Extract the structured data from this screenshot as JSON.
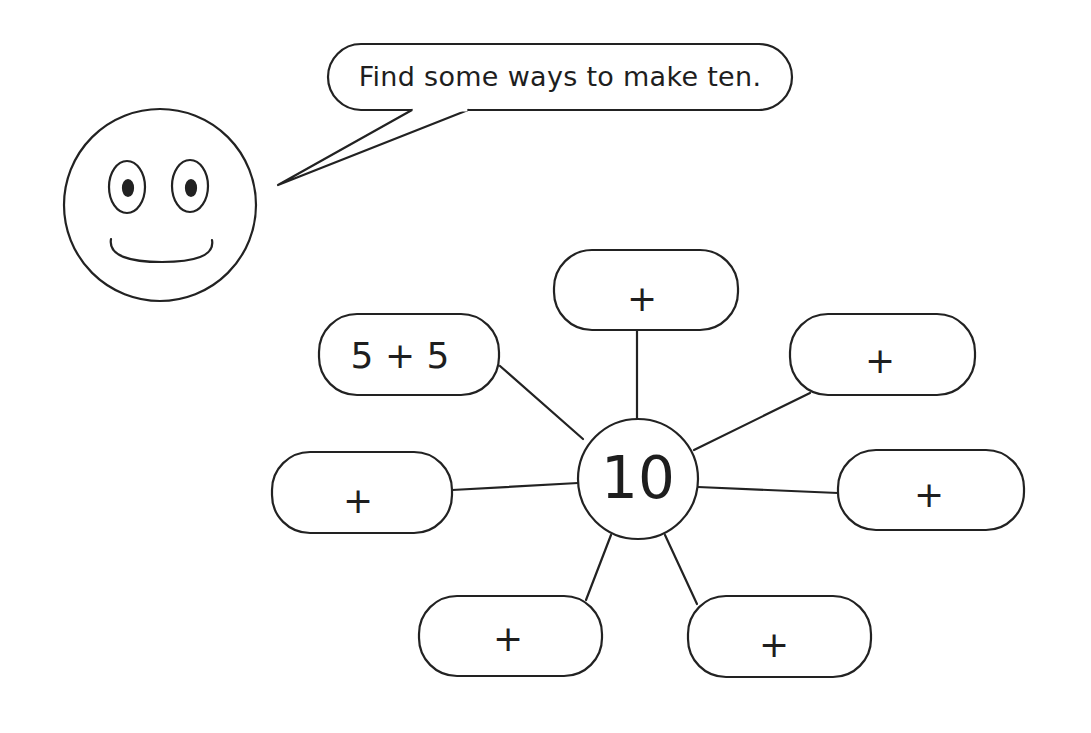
{
  "speech_bubble": {
    "text": "Find some ways to make ten."
  },
  "center": {
    "value": "10"
  },
  "boxes": [
    {
      "position": "top",
      "text": "+"
    },
    {
      "position": "upper-left",
      "text": "5 + 5"
    },
    {
      "position": "upper-right",
      "text": "+"
    },
    {
      "position": "left",
      "text": "+"
    },
    {
      "position": "right",
      "text": "+"
    },
    {
      "position": "lower-left",
      "text": "+"
    },
    {
      "position": "lower-right",
      "text": "+"
    }
  ],
  "colors": {
    "stroke": "#222222",
    "background": "#ffffff"
  }
}
